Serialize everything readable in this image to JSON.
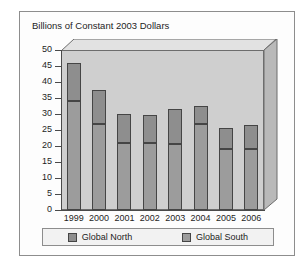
{
  "source_credit": "Congressional Research Service (2007): 38.",
  "chart": {
    "title": "Billions of Constant 2003 Dollars"
  },
  "legend": {
    "items": [
      {
        "label": "Global North",
        "color": "#8e8e8e",
        "name": "legend-global-north"
      },
      {
        "label": "Global South",
        "color": "#9c9c9c",
        "name": "legend-global-south"
      }
    ]
  },
  "chart_data": {
    "type": "bar",
    "subtype": "stacked",
    "title": "Billions of Constant 2003 Dollars",
    "xlabel": "",
    "ylabel": "Billions of Constant 2003 Dollars",
    "ylim": [
      0,
      50
    ],
    "yticks": [
      0,
      5,
      10,
      15,
      20,
      25,
      30,
      35,
      40,
      45,
      50
    ],
    "ytick_labels": [
      "0",
      "5",
      "10",
      "15",
      "20",
      "25",
      "30",
      "35",
      "40",
      "45",
      "50"
    ],
    "grid": false,
    "legend_position": "bottom",
    "categories": [
      "1999",
      "2000",
      "2001",
      "2002",
      "2003",
      "2004",
      "2005",
      "2006"
    ],
    "series": [
      {
        "name": "Global South",
        "color": "#9c9c9c",
        "values": [
          34,
          27,
          21,
          20.8,
          20.5,
          27,
          19,
          19
        ]
      },
      {
        "name": "Global North",
        "color": "#8e8e8e",
        "values": [
          12,
          10.5,
          9,
          8.8,
          11,
          5.5,
          6.5,
          7.5
        ]
      }
    ],
    "totals": [
      46,
      37.5,
      30,
      29.6,
      31.5,
      32.5,
      25.5,
      26.5
    ]
  }
}
